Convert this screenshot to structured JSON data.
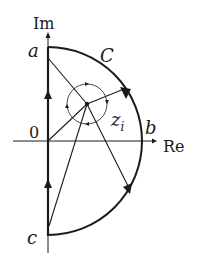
{
  "diagram": {
    "axes": {
      "imaginary_label": "Im",
      "real_label": "Re",
      "origin_label": "0"
    },
    "points": {
      "a": "a",
      "b": "b",
      "c": "c"
    },
    "contour_label": "C",
    "node_label": "z",
    "node_subscript": "i",
    "colors": {
      "stroke": "#1a1a1a",
      "background": "#ffffff"
    }
  }
}
